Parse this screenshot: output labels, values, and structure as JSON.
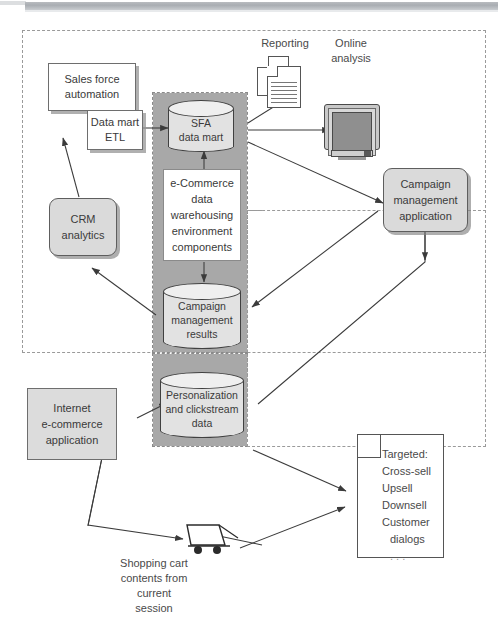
{
  "diagram": {
    "title": "e-Commerce data warehousing environment",
    "nodes": {
      "sales_force": "Sales force\nautomation",
      "sales_force_line1": "Sales force",
      "sales_force_line2": "automation",
      "data_mart_etl_line1": "Data mart",
      "data_mart_etl_line2": "ETL",
      "crm_analytics_line1": "CRM",
      "crm_analytics_line2": "analytics",
      "sfa_data_mart_line1": "SFA",
      "sfa_data_mart_line2": "data mart",
      "components_line1": "e-Commerce",
      "components_line2": "data",
      "components_line3": "warehousing",
      "components_line4": "environment",
      "components_line5": "components",
      "campaign_results_line1": "Campaign",
      "campaign_results_line2": "management",
      "campaign_results_line3": "results",
      "campaign_app_line1": "Campaign",
      "campaign_app_line2": "management",
      "campaign_app_line3": "application",
      "personalization_line1": "Personalization",
      "personalization_line2": "and clickstream",
      "personalization_line3": "data",
      "internet_app_line1": "Internet",
      "internet_app_line2": "e-commerce",
      "internet_app_line3": "application"
    },
    "labels": {
      "reporting": "Reporting",
      "online_line1": "Online",
      "online_line2": "analysis",
      "cart_line1": "Shopping cart",
      "cart_line2": "contents from",
      "cart_line3": "current",
      "cart_line4": "session"
    },
    "targeted_doc": {
      "heading": "Targeted:",
      "items": [
        "Cross-sell",
        "Upsell",
        "Downsell",
        "Customer",
        "dialogs",
        ". . ."
      ]
    },
    "icons": {
      "reporting": "document-stack-icon",
      "online_analysis": "crt-monitor-icon",
      "shopping_cart": "shopping-cart-icon",
      "targeted_output": "page-with-folded-corner-icon",
      "database": "cylinder-database-icon"
    },
    "colors": {
      "band_gray": "#a8a8a8",
      "node_gray": "#dadada",
      "cylinder_body": "#e2e2e2",
      "cylinder_top": "#efefef",
      "outline": "#555555",
      "dashed_border": "#9a9a9a",
      "text": "#3a3a3a"
    }
  }
}
